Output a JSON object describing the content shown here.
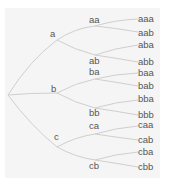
{
  "diagram": {
    "type": "tree",
    "orientation": "left-to-right",
    "colors": {
      "background": "#f5f5f5",
      "edge": "#cfcfcf",
      "text": "#555555"
    },
    "root": {
      "label": ""
    },
    "level1": [
      {
        "label": "a"
      },
      {
        "label": "b"
      },
      {
        "label": "c"
      }
    ],
    "level2": [
      {
        "label": "aa"
      },
      {
        "label": "ab"
      },
      {
        "label": "ba"
      },
      {
        "label": "bb"
      },
      {
        "label": "ca"
      },
      {
        "label": "cb"
      }
    ],
    "level3": [
      {
        "label": "aaa"
      },
      {
        "label": "aab"
      },
      {
        "label": "aba"
      },
      {
        "label": "abb"
      },
      {
        "label": "baa"
      },
      {
        "label": "bab"
      },
      {
        "label": "bba"
      },
      {
        "label": "bbb"
      },
      {
        "label": "caa"
      },
      {
        "label": "cab"
      },
      {
        "label": "cba"
      },
      {
        "label": "cbb"
      }
    ]
  }
}
